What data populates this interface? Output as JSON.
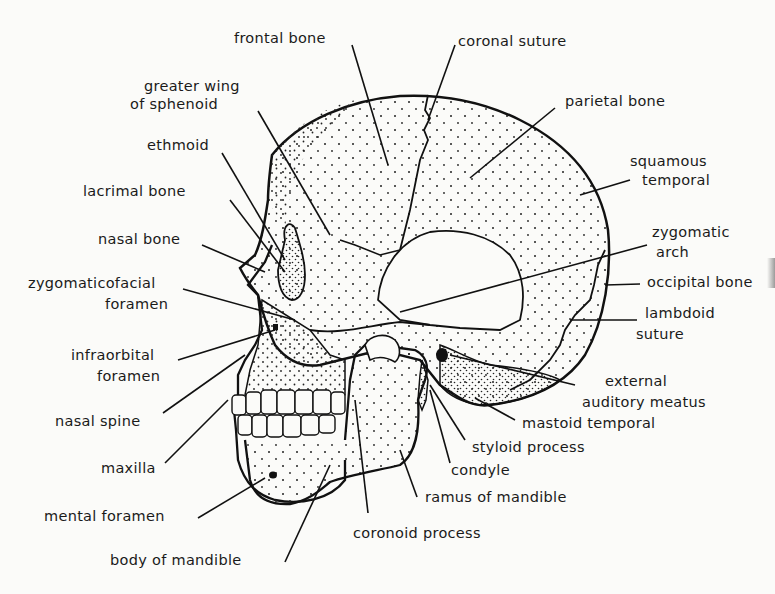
{
  "diagram": {
    "labels": {
      "frontal_bone": "frontal bone",
      "coronal_suture": "coronal suture",
      "greater_wing_1": "greater wing",
      "greater_wing_2": "of sphenoid",
      "parietal_bone": "parietal bone",
      "ethmoid": "ethmoid",
      "squamous_1": "squamous",
      "squamous_2": "temporal",
      "lacrimal_bone": "lacrimal bone",
      "nasal_bone": "nasal bone",
      "zygomatic_arch_1": "zygomatic",
      "zygomatic_arch_2": "arch",
      "zygomaticofacial_1": "zygomaticofacial",
      "zygomaticofacial_2": "foramen",
      "occipital_bone": "occipital bone",
      "lambdoid_1": "lambdoid",
      "lambdoid_2": "suture",
      "infraorbital_1": "infraorbital",
      "infraorbital_2": "foramen",
      "external_auditory_1": "external",
      "external_auditory_2": "auditory meatus",
      "nasal_spine": "nasal spine",
      "mastoid_temporal": "mastoid temporal",
      "styloid_process": "styloid process",
      "maxilla": "maxilla",
      "condyle": "condyle",
      "ramus_of_mandible": "ramus of mandible",
      "mental_foramen": "mental foramen",
      "coronoid_process": "coronoid process",
      "body_of_mandible": "body of mandible"
    }
  }
}
